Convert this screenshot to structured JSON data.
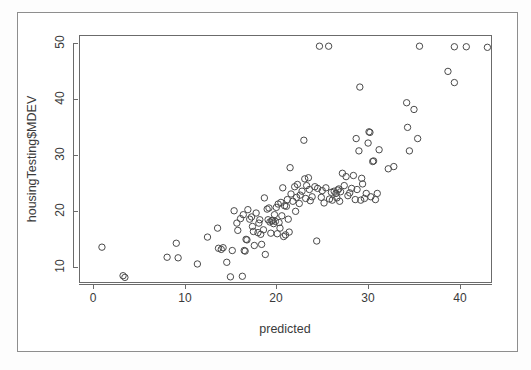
{
  "figure": {
    "background": "#ffffff",
    "frame_color": "#8e8e8e",
    "axis_color": "#6b6b6b",
    "point_color": "#4a4a4a"
  },
  "chart_data": {
    "type": "scatter",
    "title": "",
    "subtitle": "",
    "xlabel": "predicted",
    "ylabel": "housingTesting$MDEV",
    "xlim": [
      -1.5,
      43.5
    ],
    "ylim": [
      7.2,
      51.5
    ],
    "xticks": [
      0,
      10,
      20,
      30,
      40
    ],
    "yticks": [
      10,
      20,
      30,
      40,
      50
    ],
    "xticklabels": [
      "0",
      "10",
      "20",
      "30",
      "40"
    ],
    "yticklabels": [
      "10",
      "20",
      "30",
      "40",
      "50"
    ],
    "grid": false,
    "legend": null,
    "marker": "open-circle",
    "marker_size": 3.2,
    "n_points": 152,
    "annotations": [],
    "points": [
      [
        1.0,
        13.6
      ],
      [
        3.3,
        8.5
      ],
      [
        3.5,
        8.2
      ],
      [
        8.1,
        11.8
      ],
      [
        9.1,
        14.3
      ],
      [
        9.3,
        11.7
      ],
      [
        11.4,
        10.6
      ],
      [
        12.5,
        15.4
      ],
      [
        13.6,
        17.0
      ],
      [
        13.7,
        13.4
      ],
      [
        14.0,
        13.2
      ],
      [
        14.2,
        13.5
      ],
      [
        14.6,
        10.9
      ],
      [
        15.0,
        8.3
      ],
      [
        15.2,
        13.0
      ],
      [
        15.4,
        20.1
      ],
      [
        15.7,
        17.9
      ],
      [
        15.8,
        16.6
      ],
      [
        16.1,
        18.7
      ],
      [
        16.3,
        8.4
      ],
      [
        16.4,
        19.4
      ],
      [
        16.5,
        13.0
      ],
      [
        16.6,
        12.9
      ],
      [
        16.7,
        15.0
      ],
      [
        16.8,
        14.9
      ],
      [
        16.9,
        20.3
      ],
      [
        17.1,
        18.6
      ],
      [
        17.3,
        19.0
      ],
      [
        17.4,
        17.3
      ],
      [
        17.5,
        16.4
      ],
      [
        17.6,
        13.9
      ],
      [
        17.8,
        19.7
      ],
      [
        18.0,
        16.2
      ],
      [
        18.1,
        17.9
      ],
      [
        18.2,
        18.5
      ],
      [
        18.3,
        15.9
      ],
      [
        18.4,
        14.1
      ],
      [
        18.6,
        16.7
      ],
      [
        18.7,
        22.4
      ],
      [
        18.8,
        12.3
      ],
      [
        19.0,
        20.4
      ],
      [
        19.1,
        18.5
      ],
      [
        19.2,
        20.6
      ],
      [
        19.3,
        18.1
      ],
      [
        19.4,
        16.1
      ],
      [
        19.5,
        18.3
      ],
      [
        19.6,
        18.4
      ],
      [
        19.7,
        17.8
      ],
      [
        19.8,
        19.4
      ],
      [
        19.9,
        18.2
      ],
      [
        20.0,
        20.7
      ],
      [
        20.1,
        16.0
      ],
      [
        20.2,
        21.3
      ],
      [
        20.3,
        18.0
      ],
      [
        20.4,
        17.0
      ],
      [
        20.5,
        21.6
      ],
      [
        20.6,
        19.2
      ],
      [
        20.7,
        24.2
      ],
      [
        20.8,
        15.5
      ],
      [
        20.9,
        21.0
      ],
      [
        21.0,
        15.8
      ],
      [
        21.1,
        20.9
      ],
      [
        21.2,
        22.1
      ],
      [
        21.3,
        18.6
      ],
      [
        21.4,
        16.3
      ],
      [
        21.5,
        27.8
      ],
      [
        21.6,
        23.1
      ],
      [
        21.8,
        21.8
      ],
      [
        22.0,
        24.4
      ],
      [
        22.1,
        20.0
      ],
      [
        22.2,
        22.5
      ],
      [
        22.3,
        24.8
      ],
      [
        22.5,
        21.4
      ],
      [
        22.6,
        22.9
      ],
      [
        22.8,
        23.6
      ],
      [
        23.0,
        32.7
      ],
      [
        23.1,
        25.8
      ],
      [
        23.2,
        22.3
      ],
      [
        23.3,
        24.6
      ],
      [
        23.5,
        26.0
      ],
      [
        23.6,
        23.9
      ],
      [
        23.7,
        21.9
      ],
      [
        23.9,
        22.6
      ],
      [
        24.2,
        24.4
      ],
      [
        24.4,
        14.7
      ],
      [
        24.5,
        24.1
      ],
      [
        24.7,
        49.5
      ],
      [
        24.9,
        22.5
      ],
      [
        25.0,
        23.7
      ],
      [
        25.2,
        21.5
      ],
      [
        25.4,
        24.2
      ],
      [
        25.7,
        49.5
      ],
      [
        25.8,
        22.2
      ],
      [
        26.0,
        23.4
      ],
      [
        26.1,
        22.0
      ],
      [
        26.3,
        23.6
      ],
      [
        26.5,
        23.2
      ],
      [
        26.6,
        22.4
      ],
      [
        26.7,
        23.8
      ],
      [
        26.8,
        24.0
      ],
      [
        26.9,
        21.8
      ],
      [
        27.0,
        23.5
      ],
      [
        27.2,
        26.8
      ],
      [
        27.4,
        24.6
      ],
      [
        27.6,
        26.2
      ],
      [
        27.8,
        22.8
      ],
      [
        28.0,
        23.3
      ],
      [
        28.2,
        24.1
      ],
      [
        28.4,
        26.4
      ],
      [
        28.6,
        22.1
      ],
      [
        28.7,
        33.0
      ],
      [
        28.8,
        23.9
      ],
      [
        29.0,
        30.8
      ],
      [
        29.1,
        42.2
      ],
      [
        29.2,
        22.0
      ],
      [
        29.3,
        25.9
      ],
      [
        29.4,
        24.9
      ],
      [
        29.6,
        22.3
      ],
      [
        29.8,
        23.2
      ],
      [
        30.0,
        32.2
      ],
      [
        30.1,
        34.2
      ],
      [
        30.2,
        34.1
      ],
      [
        30.3,
        22.6
      ],
      [
        30.5,
        28.9
      ],
      [
        30.6,
        29.0
      ],
      [
        30.8,
        22.1
      ],
      [
        31.0,
        23.2
      ],
      [
        31.2,
        31.0
      ],
      [
        32.2,
        27.6
      ],
      [
        32.8,
        28.0
      ],
      [
        34.2,
        39.4
      ],
      [
        34.3,
        35.0
      ],
      [
        34.5,
        30.8
      ],
      [
        35.0,
        38.2
      ],
      [
        35.4,
        33.0
      ],
      [
        35.6,
        49.5
      ],
      [
        38.7,
        45.0
      ],
      [
        39.4,
        43.0
      ],
      [
        39.4,
        49.4
      ],
      [
        40.7,
        49.4
      ],
      [
        43.0,
        49.3
      ]
    ]
  }
}
